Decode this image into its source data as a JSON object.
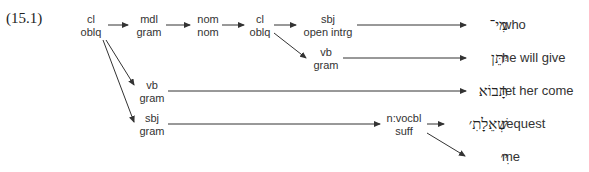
{
  "example_number": "(15.1)",
  "nodes": {
    "n1": [
      "cl",
      "oblq"
    ],
    "n2": [
      "mdl",
      "gram"
    ],
    "n3": [
      "nom",
      "nom"
    ],
    "n4": [
      "cl",
      "oblq"
    ],
    "n5": [
      "sbj",
      "open intrg"
    ],
    "n6": [
      "vb",
      "gram"
    ],
    "n7": [
      "vb",
      "gram"
    ],
    "n8": [
      "sbj",
      "gram"
    ],
    "n9": [
      "n:vocbl",
      "suff"
    ]
  },
  "hebrew": [
    "מִי־",
    "יִתֵּן",
    "תָּבוֹא",
    "שְׁאֵלָתִ׳",
    "ִי׳"
  ],
  "glosses": [
    "who",
    "he will give",
    "let her come",
    "request",
    "me"
  ]
}
